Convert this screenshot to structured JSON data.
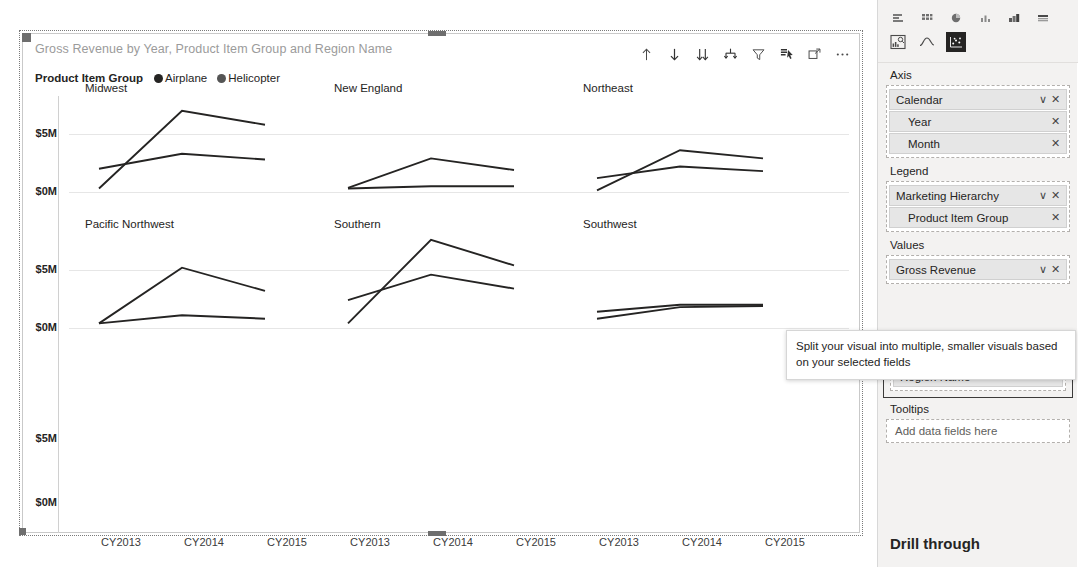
{
  "visual": {
    "title": "Gross Revenue by Year, Product Item Group and Region Name",
    "legend_title": "Product Item Group",
    "legend_items": [
      {
        "label": "Airplane",
        "color": "#252423"
      },
      {
        "label": "Helicopter",
        "color": "#555555"
      }
    ],
    "toolbar": [
      {
        "name": "drill-up-icon",
        "label": "Drill up"
      },
      {
        "name": "drill-down-icon",
        "label": "Drill down"
      },
      {
        "name": "expand-next-level-icon",
        "label": "Go to the next level in the hierarchy"
      },
      {
        "name": "expand-all-down-icon",
        "label": "Expand all down one level in the hierarchy"
      },
      {
        "name": "filter-icon",
        "label": "Filters"
      },
      {
        "name": "drill-mode-icon",
        "label": "Drill on"
      },
      {
        "name": "focus-mode-icon",
        "label": "Focus mode"
      },
      {
        "name": "more-options-icon",
        "label": "More options"
      }
    ]
  },
  "chart_data": {
    "type": "line",
    "title": "Gross Revenue by Year, Product Item Group and Region Name",
    "xlabel": "",
    "ylabel": "",
    "x": [
      "CY2013",
      "CY2014",
      "CY2015"
    ],
    "ytick_labels": [
      "$0M",
      "$5M"
    ],
    "ytick_values": [
      0,
      5
    ],
    "ylim": [
      0,
      8
    ],
    "grid": true,
    "legend_position": "top-left",
    "small_multiples_field": "Region Name",
    "panels": [
      {
        "name": "Midwest",
        "series": [
          {
            "name": "Airplane",
            "values": [
              0.3,
              7.0,
              5.8
            ]
          },
          {
            "name": "Helicopter",
            "values": [
              2.0,
              3.3,
              2.8
            ]
          }
        ]
      },
      {
        "name": "New England",
        "series": [
          {
            "name": "Airplane",
            "values": [
              0.35,
              2.9,
              1.9
            ]
          },
          {
            "name": "Helicopter",
            "values": [
              0.3,
              0.5,
              0.5
            ]
          }
        ]
      },
      {
        "name": "Northeast",
        "series": [
          {
            "name": "Airplane",
            "values": [
              0.15,
              3.6,
              2.9
            ]
          },
          {
            "name": "Helicopter",
            "values": [
              1.2,
              2.2,
              1.8
            ]
          }
        ]
      },
      {
        "name": "Pacific Northwest",
        "series": [
          {
            "name": "Airplane",
            "values": [
              0.4,
              5.2,
              3.2
            ]
          },
          {
            "name": "Helicopter",
            "values": [
              0.4,
              1.1,
              0.8
            ]
          }
        ]
      },
      {
        "name": "Southern",
        "series": [
          {
            "name": "Airplane",
            "values": [
              0.4,
              7.6,
              5.4
            ]
          },
          {
            "name": "Helicopter",
            "values": [
              2.4,
              4.6,
              3.4
            ]
          }
        ]
      },
      {
        "name": "Southwest",
        "series": [
          {
            "name": "Airplane",
            "values": [
              1.4,
              2.0,
              2.0
            ]
          },
          {
            "name": "Helicopter",
            "values": [
              0.8,
              1.8,
              1.9
            ]
          }
        ]
      }
    ],
    "empty_row_ytick_labels": [
      "$0M",
      "$5M"
    ]
  },
  "pane": {
    "gallery_row1": [
      {
        "name": "stacked-bar-chart-icon"
      },
      {
        "name": "clustered-column-chart-icon"
      },
      {
        "name": "pie-chart-icon"
      },
      {
        "name": "column-chart-icon"
      },
      {
        "name": "ribbon-chart-icon"
      },
      {
        "name": "matrix-icon"
      }
    ],
    "gallery_row2": [
      {
        "name": "key-influencers-icon",
        "selected": false
      },
      {
        "name": "line-chart-icon",
        "selected": false
      },
      {
        "name": "scatter-chart-icon",
        "selected": true
      }
    ],
    "wells": [
      {
        "label": "Axis",
        "name": "axis-well",
        "fields": [
          {
            "name": "Calendar",
            "level": 0,
            "has_chevron": true,
            "has_remove": true
          },
          {
            "name": "Year",
            "level": 1,
            "has_chevron": false,
            "has_remove": true
          },
          {
            "name": "Month",
            "level": 1,
            "has_chevron": false,
            "has_remove": true
          }
        ]
      },
      {
        "label": "Legend",
        "name": "legend-well",
        "fields": [
          {
            "name": "Marketing Hierarchy",
            "level": 0,
            "has_chevron": true,
            "has_remove": true
          },
          {
            "name": "Product Item Group",
            "level": 1,
            "has_chevron": false,
            "has_remove": true
          }
        ]
      },
      {
        "label": "Values",
        "name": "values-well",
        "fields": [
          {
            "name": "Gross Revenue",
            "level": 0,
            "has_chevron": true,
            "has_remove": true
          }
        ]
      }
    ],
    "small_multiples": {
      "label": "Small multiples",
      "fields": [
        {
          "name": "Region Name",
          "level": 0,
          "has_chevron": true,
          "has_remove": true
        }
      ]
    },
    "tooltips_well": {
      "label": "Tooltips",
      "placeholder": "Add data fields here"
    },
    "drill_through_label": "Drill through",
    "chevron_glyph": "∨",
    "remove_glyph": "✕"
  },
  "tooltip": {
    "text": "Split your visual into multiple, smaller visuals based on your selected fields"
  }
}
